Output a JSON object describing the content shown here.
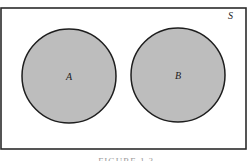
{
  "diagram": {
    "type": "venn",
    "universe": {
      "label": "S",
      "x": 1,
      "y": 8,
      "width": 245,
      "height": 141,
      "stroke": "#2b2b2b",
      "fill": "#ffffff"
    },
    "sets": [
      {
        "label": "A",
        "cx": 69,
        "cy": 76,
        "r": 47,
        "fill": "#bdbdbd",
        "stroke": "#1e1e1e"
      },
      {
        "label": "B",
        "cx": 178,
        "cy": 75,
        "r": 47,
        "fill": "#bdbdbd",
        "stroke": "#1e1e1e"
      }
    ],
    "overlap": "none"
  },
  "caption": {
    "text": "FIGURE 1.?"
  }
}
